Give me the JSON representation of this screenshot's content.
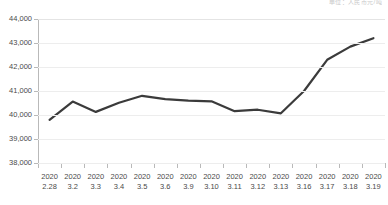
{
  "top_note": {
    "text": "单位：人民币元/吨"
  },
  "chart_data": {
    "type": "line",
    "title": "",
    "subtitle": "",
    "xlabel": "",
    "ylabel": "",
    "grid": true,
    "legend_position": "none",
    "line_color": "#3b3b3b",
    "grid_color": "#ededed",
    "axis_color": "#b9b9b9",
    "ylim": [
      38000,
      44000
    ],
    "ytick_values": [
      44000,
      43000,
      42000,
      41000,
      40000,
      39000,
      38000
    ],
    "ytick_labels": [
      "44,000",
      "43,000",
      "42,000",
      "41,000",
      "40,000",
      "39,000",
      "38,000"
    ],
    "categories": [
      "2020\n2.28",
      "2020\n3.2",
      "2020\n3.3",
      "2020\n3.4",
      "2020\n3.5",
      "2020\n3.6",
      "2020\n3.9",
      "2020\n3.10",
      "2020\n3.11",
      "2020\n3.12",
      "2020\n3.13",
      "2020\n3.16",
      "2020\n3.17",
      "2020\n3.18",
      "2020\n3.19"
    ],
    "xtick_years": [
      "2020",
      "2020",
      "2020",
      "2020",
      "2020",
      "2020",
      "2020",
      "2020",
      "2020",
      "2020",
      "2020",
      "2020",
      "2020",
      "2020",
      "2020"
    ],
    "xtick_days": [
      "2.28",
      "3.2",
      "3.3",
      "3.4",
      "3.5",
      "3.6",
      "3.9",
      "3.10",
      "3.11",
      "3.12",
      "3.13",
      "3.16",
      "3.17",
      "3.18",
      "3.19"
    ],
    "values": [
      39800,
      40560,
      40130,
      40510,
      40800,
      40660,
      40600,
      40570,
      40160,
      40220,
      40070,
      41000,
      42300,
      42850,
      43200
    ],
    "series": [
      {
        "name": "价格",
        "values": [
          39800,
          40560,
          40130,
          40510,
          40800,
          40660,
          40600,
          40570,
          40160,
          40220,
          40070,
          41000,
          42300,
          42850,
          43200
        ]
      }
    ]
  }
}
